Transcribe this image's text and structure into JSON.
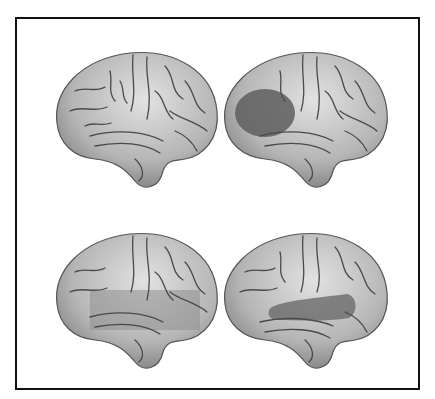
{
  "figure": {
    "layout": "2x2 grid of lateral left-hemisphere brain renderings inside a black-bordered frame",
    "panels": [
      {
        "position": "top-left",
        "highlight": "none",
        "highlight_label": ""
      },
      {
        "position": "top-right",
        "highlight": "posterior-frontal / inferior frontal region (dark shaded oval)",
        "highlight_label": ""
      },
      {
        "position": "bottom-left",
        "highlight": "broad band over superior temporal / parietal region (light shaded)",
        "highlight_label": ""
      },
      {
        "position": "bottom-right",
        "highlight": "superior temporal gyrus / sylvian region (dark shaded band)",
        "highlight_label": ""
      }
    ],
    "colors": {
      "frame_border": "#111111",
      "background": "#ffffff",
      "brain_fill": "#b9b9b9",
      "brain_light": "#d8d8d8",
      "sulci": "#4a4a4a",
      "highlight_dark": "#5e5e5e",
      "highlight_light": "#8f8f8f"
    }
  }
}
